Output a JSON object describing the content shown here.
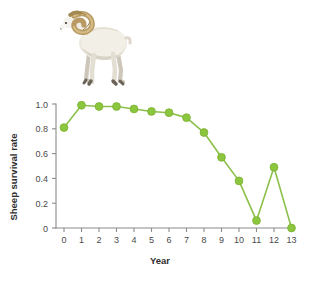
{
  "illustration": {
    "name": "bighorn-sheep-ram",
    "caption": "",
    "body_color": "#ede9e0",
    "body_shadow_color": "#cfc9bc",
    "horn_color": "#b99a63",
    "horn_shadow_color": "#8d7343",
    "leg_color": "#ddd8cc",
    "hoof_color": "#6b6357",
    "muzzle_color": "#f5f3ee"
  },
  "chart_data": {
    "type": "line",
    "title": "",
    "subtitle": "",
    "xlabel": "Year",
    "ylabel": "Sheep survival rate",
    "x": [
      0,
      1,
      2,
      3,
      4,
      5,
      6,
      7,
      8,
      9,
      10,
      11,
      12,
      13
    ],
    "categories": [
      "0",
      "1",
      "2",
      "3",
      "4",
      "5",
      "6",
      "7",
      "8",
      "9",
      "10",
      "11",
      "12",
      "13"
    ],
    "values": [
      0.81,
      0.99,
      0.98,
      0.98,
      0.96,
      0.94,
      0.93,
      0.89,
      0.77,
      0.57,
      0.38,
      0.06,
      0.49,
      0.0
    ],
    "series": [
      {
        "name": "Sheep survival rate",
        "values": [
          0.81,
          0.99,
          0.98,
          0.98,
          0.96,
          0.94,
          0.93,
          0.89,
          0.77,
          0.57,
          0.38,
          0.06,
          0.49,
          0.0
        ]
      }
    ],
    "xlim": [
      0,
      13
    ],
    "ylim": [
      0,
      1.0
    ],
    "xticks": [
      0,
      1,
      2,
      3,
      4,
      5,
      6,
      7,
      8,
      9,
      10,
      11,
      12,
      13
    ],
    "xtick_labels": [
      "0",
      "1",
      "2",
      "3",
      "4",
      "5",
      "6",
      "7",
      "8",
      "9",
      "10",
      "11",
      "12",
      "13"
    ],
    "yticks": [
      0,
      0.2,
      0.4,
      0.6,
      0.8,
      1.0
    ],
    "ytick_labels": [
      "0",
      "0.2",
      "0.4",
      "0.6",
      "0.8",
      "1.0"
    ],
    "grid": false,
    "legend": false,
    "legend_position": "none",
    "line_color": "#8cc04a",
    "marker_color": "#8cc63f",
    "marker_edge_color": "#7ab02f",
    "marker_shape": "circle",
    "axis_color": "#8c8c8c"
  }
}
